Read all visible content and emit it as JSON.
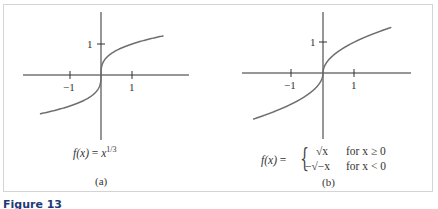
{
  "figure": {
    "label": "Figure 13",
    "panels": [
      {
        "id": "a",
        "caption": "(a)",
        "formula": "f(x) = x^{1/3}",
        "formula_parts": {
          "lhs": "f(x)",
          "eq": "=",
          "base": "x",
          "exp": "1/3"
        },
        "x_ticks": [
          "−1",
          "1"
        ],
        "y_ticks": [
          "1"
        ]
      },
      {
        "id": "b",
        "caption": "(b)",
        "formula": "f(x) = { √x for x ≥ 0 ; −√(−x) for x < 0 }",
        "formula_parts": {
          "lhs": "f(x)",
          "eq": "=",
          "case1_expr": "√x",
          "case1_cond": "for x ≥ 0",
          "case2_expr": "−√−x",
          "case2_cond": "for x < 0"
        },
        "x_ticks": [
          "−1",
          "1"
        ],
        "y_ticks": [
          "1"
        ]
      }
    ]
  },
  "chart_data": [
    {
      "type": "line",
      "title": "(a)",
      "subtitle": "f(x) = x^(1/3)",
      "xlabel": "",
      "ylabel": "",
      "xlim": [
        -2.5,
        2.9
      ],
      "ylim": [
        -2.1,
        2.0
      ],
      "x_ticks": [
        -1,
        1
      ],
      "x_tick_labels": [
        "−1",
        "1"
      ],
      "y_ticks": [
        1
      ],
      "y_tick_labels": [
        "1"
      ],
      "grid": false,
      "legend": null,
      "series": [
        {
          "name": "f(x) = x^(1/3)",
          "function": "cbrt",
          "x": [
            -1.95,
            -1.5,
            -1.0,
            -0.5,
            -0.2,
            -0.05,
            0,
            0.05,
            0.2,
            0.5,
            1.0,
            1.5,
            2.0
          ],
          "y": [
            -1.25,
            -1.14,
            -1.0,
            -0.79,
            -0.58,
            -0.37,
            0,
            0.37,
            0.58,
            0.79,
            1.0,
            1.14,
            1.26
          ]
        }
      ]
    },
    {
      "type": "line",
      "title": "(b)",
      "subtitle": "f(x) = √x for x ≥ 0; −√(−x) for x < 0",
      "xlabel": "",
      "ylabel": "",
      "xlim": [
        -2.6,
        2.8
      ],
      "ylim": [
        -2.1,
        1.9
      ],
      "x_ticks": [
        -1,
        1
      ],
      "x_tick_labels": [
        "−1",
        "1"
      ],
      "y_ticks": [
        1
      ],
      "y_tick_labels": [
        "1"
      ],
      "grid": false,
      "legend": null,
      "series": [
        {
          "name": "signed square root",
          "function": "ssqrt",
          "x": [
            -2.2,
            -1.5,
            -1.0,
            -0.5,
            -0.2,
            -0.05,
            0,
            0.05,
            0.2,
            0.5,
            1.0,
            1.5,
            2.15
          ],
          "y": [
            -1.48,
            -1.22,
            -1.0,
            -0.71,
            -0.45,
            -0.22,
            0,
            0.22,
            0.45,
            0.71,
            1.0,
            1.22,
            1.47
          ]
        }
      ]
    }
  ]
}
